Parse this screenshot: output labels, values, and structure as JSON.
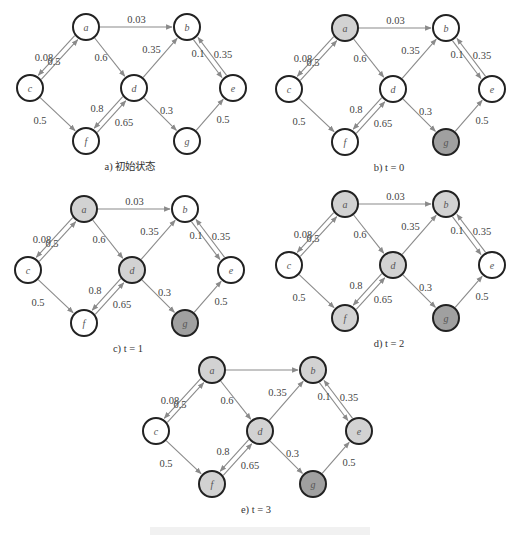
{
  "colors": {
    "unvisited": "#ffffff",
    "activated": "#d2d2d2",
    "seed": "#a0a0a0",
    "edge": "#8a8a8a",
    "outline": "#222222"
  },
  "graph": {
    "nodes": [
      "a",
      "b",
      "c",
      "d",
      "e",
      "f",
      "g"
    ],
    "edges": [
      {
        "from": "c",
        "to": "a",
        "weight": "0.08"
      },
      {
        "from": "a",
        "to": "c",
        "weight": "0.5"
      },
      {
        "from": "a",
        "to": "b",
        "weight": "0.03"
      },
      {
        "from": "a",
        "to": "d",
        "weight": "0.6"
      },
      {
        "from": "c",
        "to": "f",
        "weight": "0.5"
      },
      {
        "from": "f",
        "to": "d",
        "weight": "0.8"
      },
      {
        "from": "d",
        "to": "f",
        "weight": "0.65"
      },
      {
        "from": "d",
        "to": "b",
        "weight": "0.35"
      },
      {
        "from": "d",
        "to": "g",
        "weight": "0.3"
      },
      {
        "from": "b",
        "to": "e",
        "weight": "0.1"
      },
      {
        "from": "e",
        "to": "b",
        "weight": "0.35"
      },
      {
        "from": "g",
        "to": "e",
        "weight": "0.5"
      }
    ]
  },
  "panels": [
    {
      "id": "a",
      "caption": "a) 初始状态",
      "origin": [
        0,
        0
      ],
      "states": {
        "a": "unvisited",
        "b": "unvisited",
        "c": "unvisited",
        "d": "unvisited",
        "e": "unvisited",
        "f": "unvisited",
        "g": "unvisited"
      },
      "hidden_weights": []
    },
    {
      "id": "b",
      "caption": "b) t = 0",
      "origin": [
        259,
        1
      ],
      "states": {
        "a": "activated",
        "b": "unvisited",
        "c": "unvisited",
        "d": "unvisited",
        "e": "unvisited",
        "f": "unvisited",
        "g": "seed"
      },
      "hidden_weights": []
    },
    {
      "id": "c",
      "caption": "c) t = 1",
      "origin": [
        -2,
        182
      ],
      "states": {
        "a": "activated",
        "b": "unvisited",
        "c": "unvisited",
        "d": "activated",
        "e": "unvisited",
        "f": "unvisited",
        "g": "seed"
      },
      "hidden_weights": []
    },
    {
      "id": "d",
      "caption": "d) t = 2",
      "origin": [
        259,
        177
      ],
      "states": {
        "a": "activated",
        "b": "activated",
        "c": "unvisited",
        "d": "activated",
        "e": "unvisited",
        "f": "activated",
        "g": "seed"
      },
      "hidden_weights": []
    },
    {
      "id": "e",
      "caption": "e) t = 3",
      "origin": [
        126,
        343
      ],
      "states": {
        "a": "activated",
        "b": "activated",
        "c": "unvisited",
        "d": "activated",
        "e": "activated",
        "f": "activated",
        "g": "seed"
      },
      "hidden_weights": [
        "a-b"
      ]
    }
  ]
}
